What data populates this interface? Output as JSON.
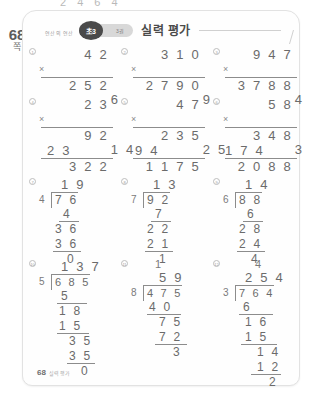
{
  "page": {
    "number": "68",
    "unit": "쪽",
    "top_bleed": "2 4 6 4"
  },
  "header": {
    "subject": "연산의 연산",
    "grade_badge": "초3",
    "volume_badge": "3권",
    "title": "실력 평가"
  },
  "footer": {
    "page_number": "68",
    "note": "실력 평가"
  },
  "problems": [
    {
      "id": "1",
      "type": "mul",
      "num": "4 2",
      "op": "×",
      "by": "6",
      "product": "2 5 2"
    },
    {
      "id": "2",
      "type": "mul",
      "num": "3 1 0",
      "op": "×",
      "by": "9",
      "product": "2 7 9 0"
    },
    {
      "id": "3",
      "type": "mul",
      "num": "9 4 7",
      "op": "×",
      "by": "4",
      "product": "3 7 8 8"
    },
    {
      "id": "4",
      "type": "mul2",
      "num": "2 3",
      "op": "×",
      "by": "1 4",
      "partial1": "9 2",
      "partial2": "2 3",
      "product": "3 2 2"
    },
    {
      "id": "5",
      "type": "mul2",
      "num": "4 7",
      "op": "×",
      "by": "2 5",
      "partial1": "2 3 5",
      "partial2": "9 4",
      "product": "1 1 7 5"
    },
    {
      "id": "6",
      "type": "mul2",
      "num": "5 8",
      "op": "×",
      "by": "3 6",
      "partial1": "3 4 8",
      "partial2": "1 7 4",
      "product": "2 0 8 8"
    },
    {
      "id": "7",
      "type": "div",
      "quotient": "1 9",
      "divisor": "4",
      "dividend": "7 6",
      "steps": [
        "4",
        "3 6",
        "3 6",
        "0"
      ]
    },
    {
      "id": "8",
      "type": "div",
      "quotient": "1 3",
      "divisor": "7",
      "dividend": "9 2",
      "steps": [
        "7",
        "2 2",
        "2 1",
        "1"
      ]
    },
    {
      "id": "9",
      "type": "div",
      "quotient": "1 4",
      "divisor": "6",
      "dividend": "8 8",
      "steps": [
        "6",
        "2 8",
        "2 4",
        "4"
      ]
    },
    {
      "id": "10",
      "type": "div3",
      "quotient": "1 3 7",
      "divisor": "5",
      "dividend": "6 8 5",
      "carry": "",
      "steps": [
        "5",
        "1 8",
        "1 5",
        "3 5",
        "3 5",
        "0"
      ]
    },
    {
      "id": "11",
      "type": "div3",
      "quotient": "5 9",
      "divisor": "8",
      "dividend": "4 7 5",
      "carry": "1",
      "steps": [
        "4 0",
        "7 5",
        "7 2",
        "3"
      ]
    },
    {
      "id": "12",
      "type": "div3",
      "quotient": "2 5 4",
      "divisor": "3",
      "dividend": "7 6 4",
      "carry": "4",
      "steps": [
        "6",
        "1 6",
        "1 5",
        "1 4",
        "1 2",
        "2"
      ]
    }
  ]
}
